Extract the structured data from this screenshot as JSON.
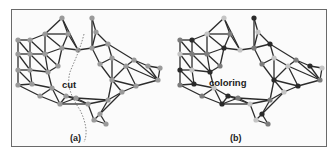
{
  "figure": {
    "panels": [
      {
        "id": "a",
        "caption": "(a)",
        "annotation": "cut",
        "node_color": "#9a9a9a",
        "nodes": [
          [
            18,
            40
          ],
          [
            30,
            40
          ],
          [
            18,
            54
          ],
          [
            30,
            54
          ],
          [
            18,
            70
          ],
          [
            30,
            70
          ],
          [
            18,
            85
          ],
          [
            32,
            84
          ],
          [
            45,
            34
          ],
          [
            45,
            54
          ],
          [
            48,
            72
          ],
          [
            62,
            18
          ],
          [
            68,
            34
          ],
          [
            62,
            48
          ],
          [
            78,
            50
          ],
          [
            58,
            66
          ],
          [
            92,
            18
          ],
          [
            96,
            32
          ],
          [
            92,
            48
          ],
          [
            108,
            44
          ],
          [
            112,
            58
          ],
          [
            100,
            64
          ],
          [
            112,
            80
          ],
          [
            126,
            66
          ],
          [
            134,
            60
          ],
          [
            148,
            66
          ],
          [
            160,
            68
          ],
          [
            158,
            80
          ],
          [
            136,
            86
          ],
          [
            122,
            92
          ],
          [
            108,
            100
          ],
          [
            100,
            114
          ],
          [
            88,
            104
          ],
          [
            76,
            98
          ],
          [
            66,
            96
          ],
          [
            52,
            88
          ],
          [
            40,
            96
          ],
          [
            60,
            104
          ],
          [
            94,
            120
          ],
          [
            106,
            124
          ]
        ],
        "edges": [
          [
            0,
            1
          ],
          [
            0,
            2
          ],
          [
            1,
            3
          ],
          [
            2,
            3
          ],
          [
            0,
            3
          ],
          [
            2,
            4
          ],
          [
            3,
            5
          ],
          [
            4,
            5
          ],
          [
            2,
            5
          ],
          [
            4,
            6
          ],
          [
            5,
            7
          ],
          [
            6,
            7
          ],
          [
            4,
            7
          ],
          [
            1,
            8
          ],
          [
            3,
            9
          ],
          [
            8,
            9
          ],
          [
            1,
            9
          ],
          [
            5,
            10
          ],
          [
            9,
            10
          ],
          [
            3,
            10
          ],
          [
            8,
            11
          ],
          [
            11,
            12
          ],
          [
            8,
            12
          ],
          [
            9,
            13
          ],
          [
            12,
            13
          ],
          [
            8,
            13
          ],
          [
            10,
            15
          ],
          [
            13,
            15
          ],
          [
            9,
            15
          ],
          [
            13,
            14
          ],
          [
            12,
            14
          ],
          [
            11,
            14
          ],
          [
            14,
            18
          ],
          [
            16,
            17
          ],
          [
            16,
            18
          ],
          [
            17,
            18
          ],
          [
            17,
            19
          ],
          [
            18,
            19
          ],
          [
            19,
            20
          ],
          [
            18,
            21
          ],
          [
            20,
            21
          ],
          [
            19,
            24
          ],
          [
            20,
            23
          ],
          [
            23,
            24
          ],
          [
            21,
            22
          ],
          [
            20,
            22
          ],
          [
            22,
            23
          ],
          [
            23,
            28
          ],
          [
            24,
            25
          ],
          [
            25,
            26
          ],
          [
            26,
            27
          ],
          [
            25,
            27
          ],
          [
            24,
            27
          ],
          [
            23,
            27
          ],
          [
            27,
            28
          ],
          [
            22,
            28
          ],
          [
            28,
            29
          ],
          [
            22,
            29
          ],
          [
            29,
            30
          ],
          [
            22,
            30
          ],
          [
            30,
            31
          ],
          [
            29,
            31
          ],
          [
            30,
            32
          ],
          [
            31,
            38
          ],
          [
            38,
            39
          ],
          [
            31,
            39
          ],
          [
            32,
            33
          ],
          [
            30,
            33
          ],
          [
            33,
            34
          ],
          [
            32,
            34
          ],
          [
            34,
            35
          ],
          [
            33,
            37
          ],
          [
            35,
            37
          ],
          [
            34,
            37
          ],
          [
            35,
            36
          ],
          [
            36,
            37
          ],
          [
            37,
            32
          ],
          [
            32,
            38
          ],
          [
            6,
            36
          ],
          [
            7,
            35
          ],
          [
            10,
            35
          ]
        ]
      },
      {
        "id": "b",
        "caption": "(b)",
        "annotation": "coloring",
        "color_classes": {
          "light": "#c4c4c4",
          "mid": "#7c7c7c",
          "dark": "#2a2a2a"
        },
        "offset_x": 162
      }
    ]
  }
}
